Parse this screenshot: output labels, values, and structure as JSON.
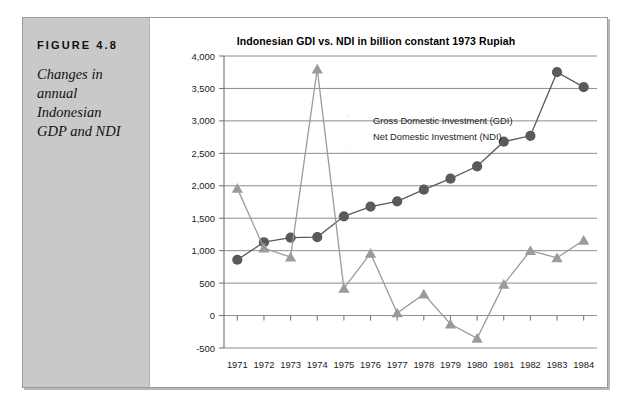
{
  "figure": {
    "label": "FIGURE 4.8",
    "caption": "Changes in annual Indonesian GDP and NDI"
  },
  "chart_data": {
    "type": "line",
    "title": "Indonesian GDI vs. NDI in billion constant 1973 Rupiah",
    "xlabel": "",
    "ylabel": "",
    "grid": true,
    "legend_position": "inside-top-left",
    "categories": [
      "1971",
      "1972",
      "1973",
      "1974",
      "1975",
      "1976",
      "1977",
      "1978",
      "1979",
      "1980",
      "1981",
      "1982",
      "1983",
      "1984"
    ],
    "x": [
      1971,
      1972,
      1973,
      1974,
      1975,
      1976,
      1977,
      1978,
      1979,
      1980,
      1981,
      1982,
      1983,
      1984
    ],
    "xlim": [
      1970.5,
      1984.5
    ],
    "ylim": [
      -500,
      4000
    ],
    "yticks": [
      -500,
      0,
      500,
      1000,
      1500,
      2000,
      2500,
      3000,
      3500,
      4000
    ],
    "ytick_labels": [
      "-500",
      "0",
      "500",
      "1,000",
      "1,500",
      "2,000",
      "2,500",
      "3,000",
      "3,500",
      "4,000"
    ],
    "series": [
      {
        "name": "Gross Domestic Investment (GDI)",
        "marker": "circle",
        "color": "#5a5a5a",
        "values": [
          860,
          1130,
          1200,
          1210,
          1530,
          1680,
          1760,
          1940,
          2110,
          2300,
          2680,
          2770,
          3750,
          3520
        ]
      },
      {
        "name": "Net Domestic Investment (NDI)",
        "marker": "triangle",
        "color": "#9b9b9b",
        "values": [
          1960,
          1040,
          900,
          3800,
          420,
          960,
          40,
          330,
          -130,
          -350,
          480,
          1000,
          890,
          1160
        ]
      }
    ]
  },
  "legend": {
    "items": [
      {
        "label": "Gross Domestic Investment (GDI)",
        "marker": "circle-marker",
        "color": "#5a5a5a"
      },
      {
        "label": "Net Domestic Investment (NDI)",
        "marker": "triangle-marker",
        "color": "#9b9b9b"
      }
    ]
  },
  "colors": {
    "gdi": "#5a5a5a",
    "ndi": "#9b9b9b",
    "grid": "#8c8c8c",
    "axis": "#6f6f6f",
    "rail": "#c9c9c9",
    "frame": "#9a9a9a"
  }
}
